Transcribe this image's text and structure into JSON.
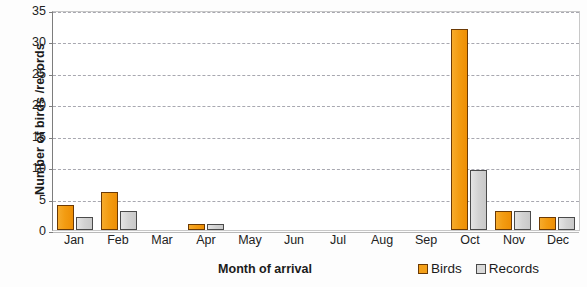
{
  "chart_data": {
    "type": "bar",
    "title": "",
    "xlabel": "Month of arrival",
    "ylabel": "Number of birds /records",
    "categories": [
      "Jan",
      "Feb",
      "Mar",
      "Apr",
      "May",
      "Jun",
      "Jul",
      "Aug",
      "Sep",
      "Oct",
      "Nov",
      "Dec"
    ],
    "series": [
      {
        "name": "Birds",
        "color": "#f3a019",
        "border": "#6b3a05",
        "values": [
          4,
          6,
          0,
          1,
          0,
          0,
          0,
          0,
          0,
          32,
          3,
          2
        ]
      },
      {
        "name": "Records",
        "color": "#d9d9d9",
        "border": "#4a4a4a",
        "values": [
          2,
          3,
          0,
          1,
          0,
          0,
          0,
          0,
          0,
          9.5,
          3,
          2
        ]
      }
    ],
    "ylim": [
      0,
      35
    ],
    "yticks": [
      0,
      5,
      10,
      15,
      20,
      25,
      30,
      35
    ],
    "ytick_labels": [
      "0",
      "5",
      "10",
      "15",
      "20",
      "25",
      "30",
      "35"
    ],
    "grid": true,
    "legend_position": "bottom-right",
    "legend": [
      "Birds",
      "Records"
    ]
  },
  "axes": {
    "y_title": "Number of birds /records",
    "x_title": "Month of arrival"
  },
  "legend": {
    "items": [
      {
        "label": "Birds"
      },
      {
        "label": "Records"
      }
    ]
  }
}
